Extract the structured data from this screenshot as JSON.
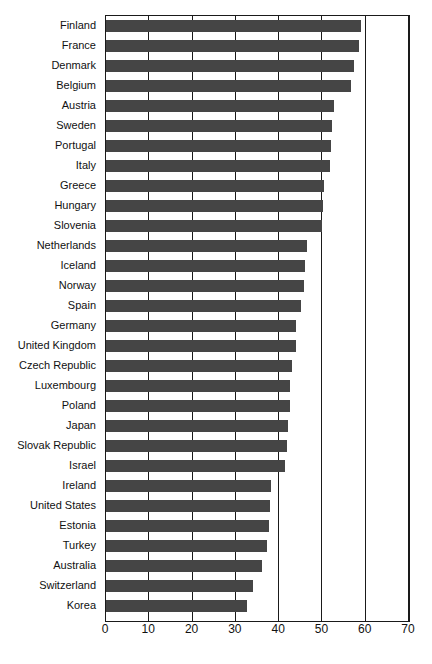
{
  "chart_data": {
    "type": "bar",
    "orientation": "horizontal",
    "title": "",
    "subtitle": "",
    "xlabel": "",
    "ylabel": "",
    "xlim": [
      0,
      70
    ],
    "xticks": [
      0,
      10,
      20,
      30,
      40,
      50,
      60,
      70
    ],
    "grid": true,
    "grid_axis": "x",
    "legend": false,
    "bar_color": "#454545",
    "axis_color": "#1a1a1a",
    "background": "#ffffff",
    "categories": [
      "Finland",
      "France",
      "Denmark",
      "Belgium",
      "Austria",
      "Sweden",
      "Portugal",
      "Italy",
      "Greece",
      "Hungary",
      "Slovenia",
      "Netherlands",
      "Iceland",
      "Norway",
      "Spain",
      "Germany",
      "United Kingdom",
      "Czech Republic",
      "Luxembourg",
      "Poland",
      "Japan",
      "Slovak Republic",
      "Israel",
      "Ireland",
      "United States",
      "Estonia",
      "Turkey",
      "Australia",
      "Switzerland",
      "Korea"
    ],
    "values": [
      58.9,
      58.4,
      57.3,
      56.6,
      52.7,
      52.3,
      52.0,
      51.7,
      50.3,
      50.2,
      50.0,
      46.4,
      46.0,
      45.7,
      45.1,
      44.0,
      43.8,
      43.0,
      42.6,
      42.4,
      42.0,
      41.8,
      41.4,
      38.2,
      38.0,
      37.7,
      37.1,
      36.0,
      34.0,
      32.5
    ]
  }
}
